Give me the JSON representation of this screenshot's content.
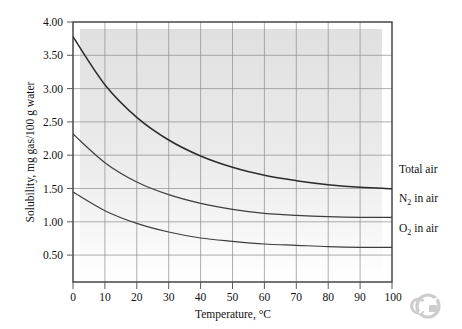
{
  "figure": {
    "background": "#ffffff",
    "plot_fill": "#e2e2e2",
    "frame_color": "#3a3a3a",
    "grid_color": "#8d8d8d",
    "curve_color": "#2b2b2b"
  },
  "chart_data": {
    "type": "line",
    "title": "",
    "xlabel": "Temperature, °C",
    "ylabel": "Solubility, mg gas/100 g water",
    "xlim": [
      0,
      100
    ],
    "ylim": [
      0.1,
      4.0
    ],
    "xticks": [
      0,
      10,
      20,
      30,
      40,
      50,
      60,
      70,
      80,
      90,
      100
    ],
    "xtick_labels": [
      "0",
      "10",
      "20",
      "30",
      "40",
      "50",
      "60",
      "70",
      "80",
      "90",
      "100"
    ],
    "yticks": [
      0.5,
      1.0,
      1.5,
      2.0,
      2.5,
      3.0,
      3.5,
      4.0
    ],
    "ytick_labels": [
      "0.50",
      "1.00",
      "1.50",
      "2.00",
      "2.50",
      "3.00",
      "3.50",
      "4.00"
    ],
    "grid": true,
    "legend_position": "right-inline-labels",
    "x": [
      0,
      10,
      20,
      30,
      40,
      50,
      60,
      70,
      80,
      90,
      100
    ],
    "series": [
      {
        "name": "Total air",
        "label_plain": "Total air",
        "label_main": "Total air",
        "label_sub": "",
        "label_tail": "",
        "values": [
          3.78,
          3.06,
          2.57,
          2.23,
          1.99,
          1.82,
          1.7,
          1.62,
          1.56,
          1.52,
          1.5
        ]
      },
      {
        "name": "N2 in air",
        "label_plain": "N2 in air",
        "label_main": "N",
        "label_sub": "2",
        "label_tail": " in air",
        "values": [
          2.32,
          1.89,
          1.6,
          1.41,
          1.28,
          1.19,
          1.13,
          1.1,
          1.08,
          1.07,
          1.07
        ]
      },
      {
        "name": "O2 in air",
        "label_plain": "O2 in air",
        "label_main": "O",
        "label_sub": "2",
        "label_tail": " in air",
        "values": [
          1.45,
          1.17,
          0.98,
          0.85,
          0.76,
          0.71,
          0.67,
          0.65,
          0.63,
          0.62,
          0.62
        ]
      }
    ]
  }
}
